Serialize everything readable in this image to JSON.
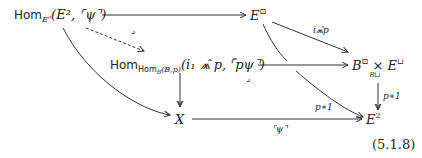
{
  "diagram": {
    "nodes": {
      "hom_top": {
        "prefix": "Hom",
        "sub": "E⁰",
        "args": "(E², ⌜ψ⌝)"
      },
      "e_box": {
        "base": "E",
        "sup": "⊡"
      },
      "hom_mid": {
        "prefix": "Hom",
        "sub": "Hom",
        "subsub": "B",
        "subargs": "(B,p)",
        "args": "(i₁ ⩕̂ p, ⌜pψ⌝)"
      },
      "pullback": {
        "base1": "B",
        "sup1": "⊡",
        "times": "×",
        "under": "B⊔",
        "base2": "E",
        "sup2": "⊔"
      },
      "x": {
        "label": "X"
      },
      "e2": {
        "base": "E",
        "sup": "2"
      }
    },
    "arrows": {
      "top": "",
      "i_hat_p": "i⩕̂p",
      "p_star_1_right": "p∗1",
      "p_star_1_curve": "p∗1",
      "bottom": "⌜ψ⌝",
      "dashed": "",
      "left_curve": "",
      "mid_down": ""
    },
    "pullback_corners": [
      "⌟",
      "⌟"
    ],
    "equation_number": "(5.1.8)"
  }
}
